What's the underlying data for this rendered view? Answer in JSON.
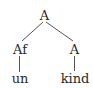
{
  "diagram": {
    "type": "morphological-tree",
    "nodes": {
      "root": {
        "label": "A"
      },
      "left": {
        "label": "Af"
      },
      "right": {
        "label": "A"
      },
      "left_leaf": {
        "label": "un"
      },
      "right_leaf": {
        "label": "kind"
      }
    },
    "edges": [
      {
        "from": "root",
        "to": "left"
      },
      {
        "from": "root",
        "to": "right"
      },
      {
        "from": "left",
        "to": "left_leaf"
      },
      {
        "from": "right",
        "to": "right_leaf"
      }
    ],
    "colors": {
      "text": "#2a2a2a",
      "line": "#555555",
      "background": "#ffffff"
    }
  }
}
